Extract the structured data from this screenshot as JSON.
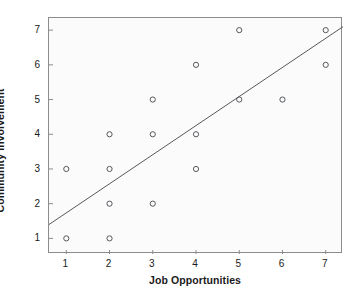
{
  "chart_data": {
    "type": "scatter",
    "title": "",
    "xlabel": "Job Opportunities",
    "ylabel": "Community Involvement",
    "xlim": [
      0.6,
      7.4
    ],
    "ylim": [
      0.55,
      7.35
    ],
    "xticks": [
      "1",
      "2",
      "3",
      "4",
      "5",
      "6",
      "7"
    ],
    "xtick_values": [
      1,
      2,
      3,
      4,
      5,
      6,
      7
    ],
    "yticks": [
      "1",
      "2",
      "3",
      "4",
      "5",
      "6",
      "7"
    ],
    "ytick_values": [
      1,
      2,
      3,
      4,
      5,
      6,
      7
    ],
    "grid": false,
    "legend": "none",
    "marker": "open-circle",
    "marker_color": "#55585c",
    "points": [
      {
        "x": 1,
        "y": 3
      },
      {
        "x": 1,
        "y": 1
      },
      {
        "x": 2,
        "y": 4
      },
      {
        "x": 2,
        "y": 3
      },
      {
        "x": 2,
        "y": 2
      },
      {
        "x": 2,
        "y": 1
      },
      {
        "x": 3,
        "y": 5
      },
      {
        "x": 3,
        "y": 4
      },
      {
        "x": 3,
        "y": 2
      },
      {
        "x": 4,
        "y": 6
      },
      {
        "x": 4,
        "y": 4
      },
      {
        "x": 4,
        "y": 3
      },
      {
        "x": 5,
        "y": 7
      },
      {
        "x": 5,
        "y": 5
      },
      {
        "x": 6,
        "y": 5
      },
      {
        "x": 7,
        "y": 7
      },
      {
        "x": 7,
        "y": 6
      }
    ],
    "series": [
      {
        "name": "fit-line",
        "type": "line",
        "color": "#55585c",
        "x": [
          0.6,
          7.4
        ],
        "y": [
          1.4,
          7.1
        ]
      }
    ],
    "background": "#fbfbfb",
    "frame_color": "#8c8c8c"
  }
}
